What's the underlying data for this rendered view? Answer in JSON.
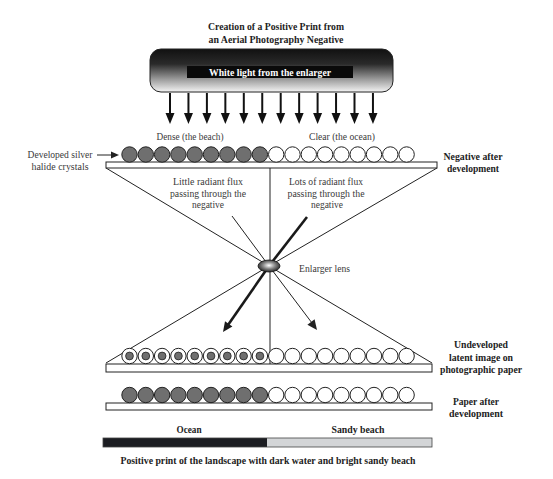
{
  "title": {
    "line1": "Creation of a Positive Print from",
    "line2": "an Aerial Photography Negative"
  },
  "enlarger": {
    "label": "White light from the enlarger",
    "arrow_count": 12
  },
  "negative": {
    "dense_label": "Dense (the beach)",
    "clear_label": "Clear (the ocean)",
    "crystals_label": [
      "Developed silver",
      "halide crystals"
    ],
    "side_label": [
      "Negative after",
      "development"
    ],
    "crystals": [
      "dense",
      "dense",
      "dense",
      "dense",
      "dense",
      "dense",
      "dense",
      "dense",
      "dense",
      "clear",
      "clear",
      "clear",
      "clear",
      "clear",
      "clear",
      "clear",
      "clear",
      "clear"
    ]
  },
  "flux": {
    "little": [
      "Little radiant flux",
      "passing through the",
      "negative"
    ],
    "lots": [
      "Lots of radiant flux",
      "passing through the",
      "negative"
    ]
  },
  "lens": {
    "label": "Enlarger lens"
  },
  "latent": {
    "side_label": [
      "Undeveloped",
      "latent image on",
      "photographic paper"
    ],
    "crystals": [
      "exposed",
      "exposed",
      "exposed",
      "exposed",
      "exposed",
      "exposed",
      "exposed",
      "exposed",
      "exposed",
      "unexposed",
      "unexposed",
      "unexposed",
      "unexposed",
      "unexposed",
      "unexposed",
      "unexposed",
      "unexposed",
      "unexposed"
    ]
  },
  "paper": {
    "side_label": [
      "Paper after",
      "development"
    ],
    "crystals": [
      "dense",
      "dense",
      "dense",
      "dense",
      "dense",
      "dense",
      "dense",
      "dense",
      "dense",
      "clear",
      "clear",
      "clear",
      "clear",
      "clear",
      "clear",
      "clear",
      "clear",
      "clear"
    ]
  },
  "print": {
    "ocean_label": "Ocean",
    "beach_label": "Sandy beach",
    "caption": "Positive print of the landscape with  dark water and bright sandy beach"
  },
  "colors": {
    "ink": "#222222",
    "dense_crystal": "#6f6f6f",
    "clear_crystal": "#ffffff",
    "ocean": "#1c1d22",
    "beach": "#d3d5d7",
    "enlarger_top": "#111111",
    "enlarger_bottom": "#f4f4f4"
  }
}
